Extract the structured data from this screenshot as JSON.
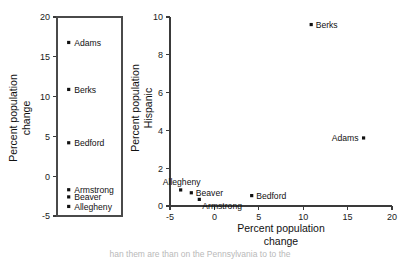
{
  "figure": {
    "background": "#ffffff",
    "ink_color": "#111111",
    "axis_color": "#3a3a3a",
    "caption": "han them are than on the Pennsylvania to to the"
  },
  "chart_data": [
    {
      "id": "left-panel",
      "type": "scatter",
      "title": "",
      "xlabel": "",
      "ylabel": "Percent population change",
      "ylabel_lines": [
        "Percent population",
        "change"
      ],
      "ylim": [
        -5,
        20
      ],
      "yticks": [
        -5,
        0,
        5,
        10,
        15,
        20
      ],
      "ytick_labels": [
        "-5",
        "0",
        "5",
        "10",
        "15",
        "20"
      ],
      "xlim": [
        0,
        1
      ],
      "xticks": [],
      "xtick_labels": [],
      "grid": false,
      "box": true,
      "legend": "none",
      "points": [
        {
          "label": "Adams",
          "x": 0.18,
          "y": 16.8
        },
        {
          "label": "Berks",
          "x": 0.18,
          "y": 10.9
        },
        {
          "label": "Bedford",
          "x": 0.18,
          "y": 4.2
        },
        {
          "label": "Armstrong",
          "x": 0.18,
          "y": -1.7
        },
        {
          "label": "Beaver",
          "x": 0.18,
          "y": -2.6
        },
        {
          "label": "Allegheny",
          "x": 0.18,
          "y": -3.8
        }
      ]
    },
    {
      "id": "right-panel",
      "type": "scatter",
      "title": "",
      "xlabel": "Percent population change",
      "xlabel_lines": [
        "Percent population",
        "change"
      ],
      "ylabel": "Percent population Hispanic",
      "ylabel_lines": [
        "Percent population",
        "Hispanic"
      ],
      "xlim": [
        -5,
        20
      ],
      "xticks": [
        -5,
        0,
        5,
        10,
        15,
        20
      ],
      "xtick_labels": [
        "-5",
        "0",
        "5",
        "10",
        "15",
        "20"
      ],
      "ylim": [
        0,
        10
      ],
      "yticks": [
        0,
        2,
        4,
        6,
        8,
        10
      ],
      "ytick_labels": [
        "0",
        "2",
        "4",
        "6",
        "8",
        "10"
      ],
      "grid": false,
      "box": false,
      "legend": "none",
      "points": [
        {
          "label": "Berks",
          "x": 10.9,
          "y": 9.6,
          "label_pos": "right"
        },
        {
          "label": "Adams",
          "x": 16.8,
          "y": 3.6,
          "label_pos": "left"
        },
        {
          "label": "Bedford",
          "x": 4.2,
          "y": 0.55,
          "label_pos": "right"
        },
        {
          "label": "Allegheny",
          "x": -3.8,
          "y": 0.85,
          "label_pos": "above"
        },
        {
          "label": "Beaver",
          "x": -2.6,
          "y": 0.7,
          "label_pos": "right"
        },
        {
          "label": "Armstrong",
          "x": -1.7,
          "y": 0.35,
          "label_pos": "below-right"
        }
      ]
    }
  ]
}
